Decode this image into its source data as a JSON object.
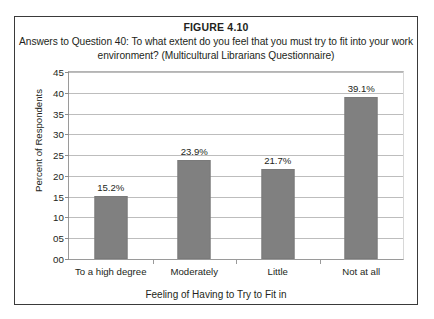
{
  "figure": {
    "label": "FIGURE 4.10",
    "caption": "Answers to Question 40: To what extent do you feel that you must try to fit into your work environment? (Multicultural Librarians Questionnaire)"
  },
  "colors": {
    "bar_fill": "#808080",
    "bar_stroke": "#7a7a7a",
    "gridline": "#bdbdbd",
    "axis": "#9a9a9a",
    "frame": "#3a3a3a",
    "text": "#231f20"
  },
  "chart_data": {
    "type": "bar",
    "title": "Answers to Question 40: To what extent do you feel that you must try to fit into your work environment? (Multicultural Librarians Questionnaire)",
    "xlabel": "Feeling of Having to Try to Fit in",
    "ylabel": "Percent of Respondents",
    "categories": [
      "To a high degree",
      "Moderately",
      "Little",
      "Not at all"
    ],
    "values": [
      15.2,
      23.9,
      21.7,
      39.1
    ],
    "data_labels": [
      "15.2%",
      "23.9%",
      "21.7%",
      "39.1%"
    ],
    "ylim": [
      0,
      45
    ],
    "ytick_values": [
      0,
      5,
      10,
      15,
      20,
      25,
      30,
      35,
      40,
      45
    ],
    "ytick_labels": [
      "00",
      "05",
      "10",
      "15",
      "20",
      "25",
      "30",
      "35",
      "40",
      "45"
    ],
    "grid": true,
    "legend": false,
    "legend_position": "none",
    "series": [
      {
        "name": "Percent of Respondents",
        "values": [
          15.2,
          23.9,
          21.7,
          39.1
        ]
      }
    ]
  }
}
